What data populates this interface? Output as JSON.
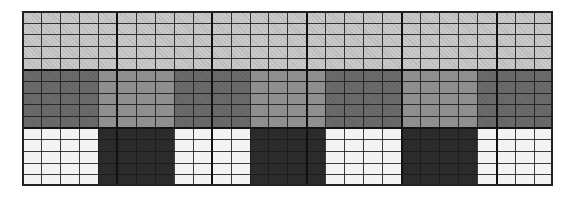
{
  "grid": {
    "columns": 28,
    "rows_per_band": 5,
    "col_width": 18.96,
    "band_height": 58.33,
    "major_column_lines": [
      5,
      10,
      15,
      20,
      25
    ],
    "colors": {
      "light_gray": "#c9c9c9",
      "dark_gray": "#6b6b6b",
      "medium_gray": "#8f8f8f",
      "white": "#f3f3f3",
      "black": "#2b2b2b"
    },
    "bands": [
      {
        "name": "top-band",
        "segments": [
          {
            "start": 0,
            "span": 28,
            "color": "light_gray",
            "hatch": true
          }
        ]
      },
      {
        "name": "middle-band",
        "segments": [
          {
            "start": 0,
            "span": 4,
            "color": "dark_gray",
            "hatch": true
          },
          {
            "start": 4,
            "span": 4,
            "color": "medium_gray",
            "hatch": false
          },
          {
            "start": 8,
            "span": 4,
            "color": "dark_gray",
            "hatch": true
          },
          {
            "start": 12,
            "span": 4,
            "color": "medium_gray",
            "hatch": false
          },
          {
            "start": 16,
            "span": 4,
            "color": "dark_gray",
            "hatch": true
          },
          {
            "start": 20,
            "span": 4,
            "color": "medium_gray",
            "hatch": false
          },
          {
            "start": 24,
            "span": 4,
            "color": "dark_gray",
            "hatch": true
          }
        ]
      },
      {
        "name": "bottom-band",
        "segments": [
          {
            "start": 0,
            "span": 4,
            "color": "white",
            "hatch": false
          },
          {
            "start": 4,
            "span": 4,
            "color": "black",
            "hatch": false
          },
          {
            "start": 8,
            "span": 4,
            "color": "white",
            "hatch": false
          },
          {
            "start": 12,
            "span": 4,
            "color": "black",
            "hatch": false
          },
          {
            "start": 16,
            "span": 4,
            "color": "white",
            "hatch": false
          },
          {
            "start": 20,
            "span": 4,
            "color": "black",
            "hatch": false
          },
          {
            "start": 24,
            "span": 4,
            "color": "white",
            "hatch": false
          }
        ]
      }
    ]
  }
}
